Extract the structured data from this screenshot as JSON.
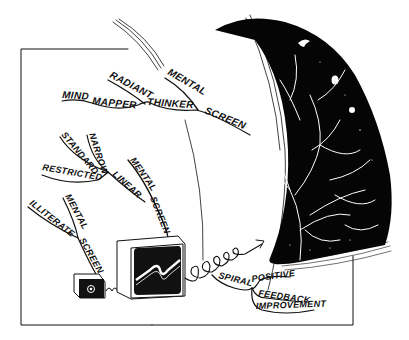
{
  "illustration": {
    "colors": {
      "ink": "#111111",
      "paper": "#ffffff",
      "space": "#050505",
      "star": "#ffffff"
    },
    "top_branch": {
      "words": [
        "MIND",
        "MAPPER",
        "RADIANT",
        "THINKER",
        "MENTAL",
        "SCREEN"
      ]
    },
    "middle_branch": {
      "words": [
        "STANDARD",
        "NARROW",
        "RESTRICTED",
        "LINEAR",
        "MENTAL",
        "SCREEN"
      ]
    },
    "lower_branch": {
      "words": [
        "ILLITERATE",
        "MENTAL",
        "SCREEN"
      ]
    },
    "spiral_branch": {
      "words": [
        "SPIRAL",
        "POSITIVE",
        "FEEDBACK",
        "IMPROVEMENT"
      ]
    }
  }
}
